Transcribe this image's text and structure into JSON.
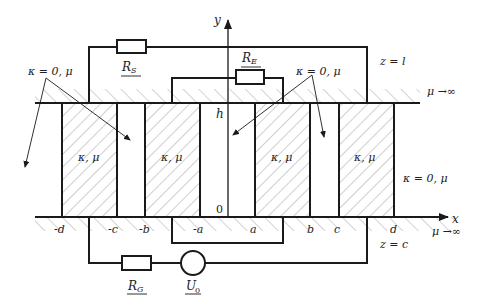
{
  "diagram": {
    "axes": {
      "x_label": "x",
      "y_label": "y",
      "origin_label": "0",
      "h_label": "h"
    },
    "x_ticks": [
      "-d",
      "-c",
      "-b",
      "-a",
      "a",
      "b",
      "c",
      "d"
    ],
    "regions": {
      "top_plane": {
        "label": "z = l",
        "mu_label": "μ →∞"
      },
      "bottom_plane": {
        "label": "z = c",
        "mu_label": "μ →∞"
      },
      "block_label": "κ, μ",
      "air_label_left": "κ = 0, μ",
      "air_label_mid": "κ = 0, μ",
      "air_label_right": "κ = 0, μ"
    },
    "components": {
      "resistor_s": {
        "label": "R",
        "subscript": "S"
      },
      "resistor_e": {
        "label": "R",
        "subscript": "E"
      },
      "resistor_g": {
        "label": "R",
        "subscript": "G"
      },
      "source": {
        "label": "U",
        "subscript": "0"
      }
    },
    "colors": {
      "line": "#1a1a1a",
      "hatch": "#9a9a9a",
      "background": "#ffffff"
    }
  }
}
